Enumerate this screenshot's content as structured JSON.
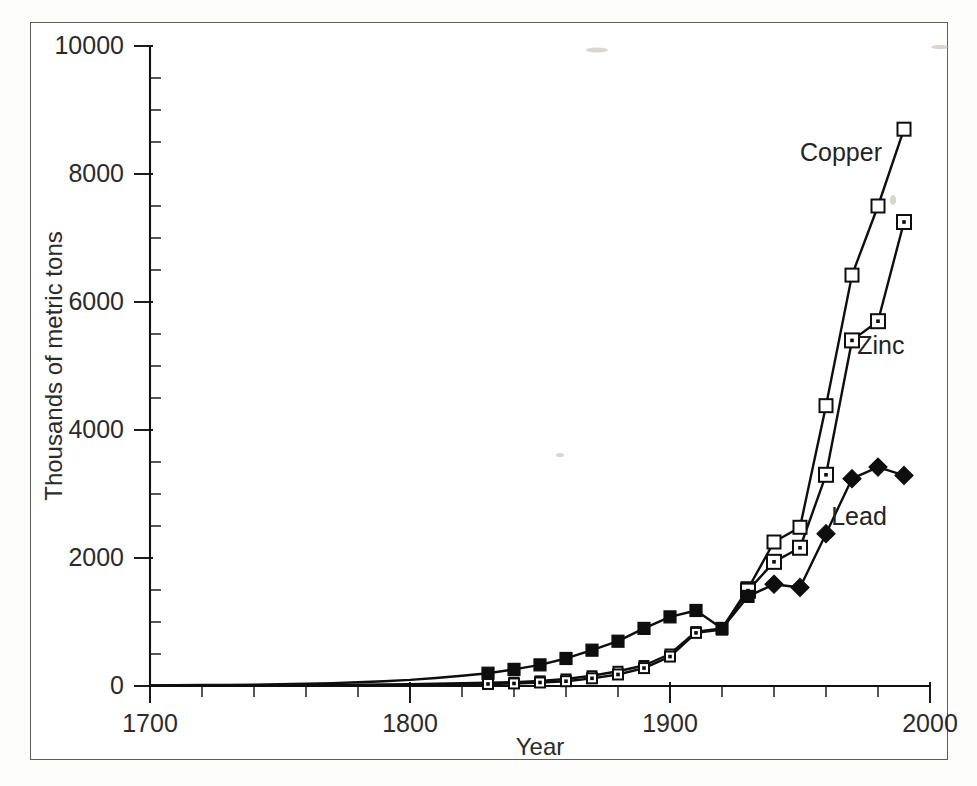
{
  "page": {
    "background_color": "#fdfdfc",
    "frame_color": "#5d5d5d",
    "ink_color": "#0e0e0e"
  },
  "chart_data": {
    "type": "line",
    "title": "",
    "subtitle": "",
    "xlabel": "Year",
    "ylabel": "Thousands of metric tons",
    "xlim": [
      1700,
      2000
    ],
    "ylim": [
      0,
      10000
    ],
    "xticks": [
      1700,
      1800,
      1900,
      2000
    ],
    "xtick_labels": [
      "1700",
      "1800",
      "1900",
      "2000"
    ],
    "yticks": [
      0,
      2000,
      4000,
      6000,
      8000,
      10000
    ],
    "ytick_labels": [
      "0",
      "2000",
      "4000",
      "6000",
      "8000",
      "10000"
    ],
    "x_minor_step": 20,
    "y_minor_step": 500,
    "grid": false,
    "legend_position": "inline-annotations",
    "x": [
      1700,
      1710,
      1720,
      1730,
      1740,
      1750,
      1760,
      1770,
      1780,
      1790,
      1800,
      1810,
      1820,
      1830,
      1840,
      1850,
      1860,
      1870,
      1880,
      1890,
      1900,
      1910,
      1920,
      1930,
      1940,
      1950,
      1960,
      1970,
      1980,
      1990
    ],
    "series": [
      {
        "name": "Copper",
        "marker": "open-square",
        "label": "Copper",
        "values": [
          5,
          6,
          7,
          8,
          10,
          12,
          14,
          17,
          20,
          24,
          29,
          35,
          42,
          50,
          60,
          80,
          110,
          160,
          230,
          320,
          500,
          850,
          900,
          1520,
          2250,
          2480,
          4380,
          6420,
          7500,
          8700
        ]
      },
      {
        "name": "Zinc",
        "marker": "dotted-square",
        "label": "Zinc",
        "values": [
          2,
          3,
          3,
          4,
          5,
          6,
          7,
          9,
          11,
          14,
          17,
          21,
          26,
          32,
          40,
          55,
          75,
          120,
          180,
          280,
          460,
          830,
          880,
          1490,
          1940,
          2160,
          3300,
          5400,
          5700,
          7250
        ]
      },
      {
        "name": "Lead",
        "marker": "filled",
        "label": "Lead",
        "values": [
          10,
          12,
          15,
          18,
          22,
          28,
          35,
          45,
          58,
          75,
          95,
          125,
          160,
          200,
          260,
          330,
          430,
          560,
          700,
          900,
          1080,
          1180,
          900,
          1400,
          1590,
          1540,
          2380,
          3240,
          3420,
          3290
        ]
      }
    ],
    "annotations": [
      {
        "text": "Copper",
        "x": 1950,
        "y": 8200
      },
      {
        "text": "Zinc",
        "x": 1972,
        "y": 5180
      },
      {
        "text": "Lead",
        "x": 1962,
        "y": 2520
      }
    ]
  }
}
